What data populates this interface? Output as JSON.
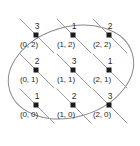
{
  "figure": {
    "name": "lattice-points-in-ellipse",
    "width": 140,
    "height": 146,
    "background_color": "#ffffff",
    "outline_color": "#8a8a8a",
    "line_color": "#9a9a9a",
    "dot_color": "#1a1a1a",
    "text_color": "#2b2b2b"
  },
  "chart_data": {
    "type": "scatter",
    "title": "",
    "xlabel": "",
    "ylabel": "",
    "xlim": [
      0,
      2
    ],
    "ylim": [
      0,
      2
    ],
    "grid": false,
    "legend": null,
    "annotations": {
      "ellipse": "tilted ellipse enclosing all nine lattice points",
      "diagonals": "parallel diagonal lines of slope -1 passing through each point"
    },
    "points": [
      {
        "coord_label": "(0, 2)",
        "x": 0,
        "y": 2,
        "value_label": "3",
        "value": 3,
        "px": 36,
        "py": 35
      },
      {
        "coord_label": "(1, 2)",
        "x": 1,
        "y": 2,
        "value_label": "1",
        "value": 1,
        "px": 73,
        "py": 35
      },
      {
        "coord_label": "(2, 2)",
        "x": 2,
        "y": 2,
        "value_label": "2",
        "value": 2,
        "px": 109,
        "py": 35
      },
      {
        "coord_label": "(0, 1)",
        "x": 0,
        "y": 1,
        "value_label": "2",
        "value": 2,
        "px": 36,
        "py": 70
      },
      {
        "coord_label": "(1, 1)",
        "x": 1,
        "y": 1,
        "value_label": "3",
        "value": 3,
        "px": 73,
        "py": 70
      },
      {
        "coord_label": "(2, 1)",
        "x": 2,
        "y": 1,
        "value_label": "1",
        "value": 1,
        "px": 109,
        "py": 70
      },
      {
        "coord_label": "(0, 0)",
        "x": 0,
        "y": 0,
        "value_label": "1",
        "value": 1,
        "px": 36,
        "py": 105
      },
      {
        "coord_label": "(1, 0)",
        "x": 1,
        "y": 0,
        "value_label": "2",
        "value": 2,
        "px": 73,
        "py": 105
      },
      {
        "coord_label": "(2, 0)",
        "x": 2,
        "y": 0,
        "value_label": "3",
        "value": 3,
        "px": 109,
        "py": 105
      }
    ]
  }
}
